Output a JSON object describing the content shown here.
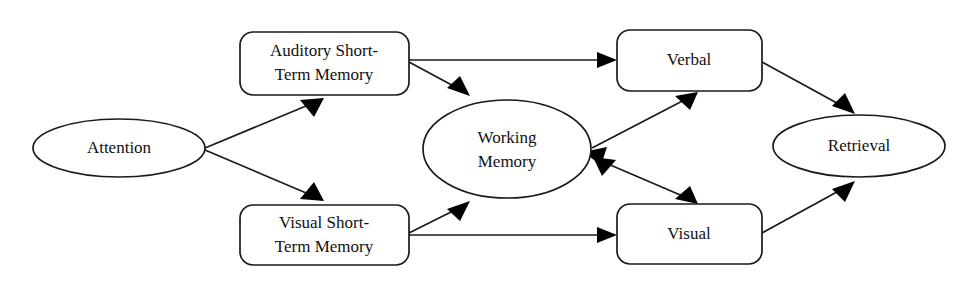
{
  "diagram": {
    "type": "flow-diagram",
    "canvas": {
      "width": 966,
      "height": 286,
      "background": "#ffffff"
    },
    "stroke_color": "#1a1a1a",
    "text_color": "#111111",
    "nodes": [
      {
        "id": "attention",
        "label": "Attention",
        "line1": "Attention",
        "line2": "",
        "shape": "ellipse",
        "cx": 119,
        "cy": 148,
        "rx": 86,
        "ry": 29
      },
      {
        "id": "auditory-short-term-memory",
        "label": "Auditory Short-Term Memory",
        "line1": "Auditory Short-",
        "line2": "Term Memory",
        "shape": "rounded-rect",
        "x": 240,
        "y": 32,
        "width": 169,
        "height": 63,
        "radius": 13
      },
      {
        "id": "visual-short-term-memory",
        "label": "Visual Short-Term Memory",
        "line1": "Visual Short-",
        "line2": "Term Memory",
        "shape": "rounded-rect",
        "x": 240,
        "y": 205,
        "width": 169,
        "height": 60,
        "radius": 13
      },
      {
        "id": "working-memory",
        "label": "Working Memory",
        "line1": "Working",
        "line2": "Memory",
        "shape": "ellipse",
        "cx": 507,
        "cy": 149,
        "rx": 84,
        "ry": 49
      },
      {
        "id": "verbal",
        "label": "Verbal",
        "line1": "Verbal",
        "line2": "",
        "shape": "rounded-rect",
        "x": 617,
        "y": 30,
        "width": 145,
        "height": 61,
        "radius": 13
      },
      {
        "id": "visual",
        "label": "Visual",
        "line1": "Visual",
        "line2": "",
        "shape": "rounded-rect",
        "x": 617,
        "y": 204,
        "width": 145,
        "height": 60,
        "radius": 13
      },
      {
        "id": "retrieval",
        "label": "Retrieval",
        "line1": "Retrieval",
        "line2": "",
        "shape": "ellipse",
        "cx": 859,
        "cy": 146,
        "rx": 86,
        "ry": 31
      }
    ],
    "edges": [
      {
        "id": "attention-to-auditory",
        "from": "attention",
        "to": "auditory-short-term-memory",
        "direction": "one-way"
      },
      {
        "id": "attention-to-visual-stm",
        "from": "attention",
        "to": "visual-short-term-memory",
        "direction": "one-way"
      },
      {
        "id": "auditory-to-verbal",
        "from": "auditory-short-term-memory",
        "to": "verbal",
        "direction": "one-way"
      },
      {
        "id": "auditory-to-working-memory",
        "from": "auditory-short-term-memory",
        "to": "working-memory",
        "direction": "one-way"
      },
      {
        "id": "visual-stm-to-visual",
        "from": "visual-short-term-memory",
        "to": "visual",
        "direction": "one-way"
      },
      {
        "id": "visual-stm-to-working-memory",
        "from": "visual-short-term-memory",
        "to": "working-memory",
        "direction": "one-way"
      },
      {
        "id": "working-memory-verbal",
        "from": "working-memory",
        "to": "verbal",
        "direction": "bidirectional"
      },
      {
        "id": "working-memory-visual",
        "from": "working-memory",
        "to": "visual",
        "direction": "bidirectional"
      },
      {
        "id": "verbal-to-retrieval",
        "from": "verbal",
        "to": "retrieval",
        "direction": "one-way"
      },
      {
        "id": "visual-to-retrieval",
        "from": "visual",
        "to": "retrieval",
        "direction": "one-way"
      }
    ]
  }
}
